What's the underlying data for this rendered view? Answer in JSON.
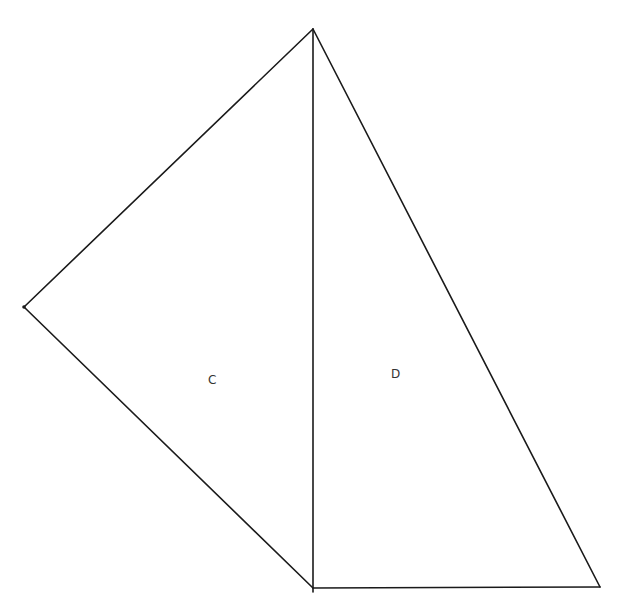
{
  "diagram": {
    "type": "geometric-figure",
    "points": {
      "top": [
        313,
        29
      ],
      "left": [
        24,
        307
      ],
      "bottom": [
        313,
        588
      ],
      "right": [
        600,
        587
      ]
    },
    "regions": [
      {
        "label": "C",
        "x": 212,
        "y": 384
      },
      {
        "label": "D",
        "x": 395,
        "y": 378
      }
    ],
    "colors": {
      "line": "#1a1a1a",
      "label": "#333333",
      "background": "#ffffff"
    }
  }
}
